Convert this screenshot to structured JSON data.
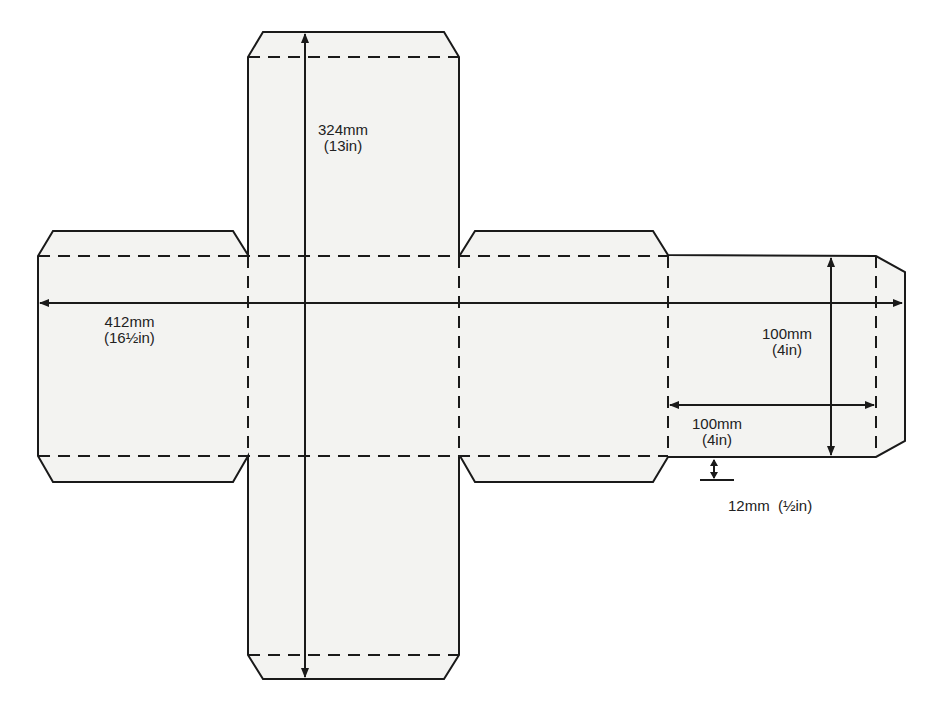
{
  "diagram": {
    "type": "cube-net",
    "colors": {
      "fill": "#f3f3f1",
      "stroke": "#1a1a1a"
    },
    "dimensions": {
      "height": {
        "mm": "324mm",
        "inch": "(13in)"
      },
      "width": {
        "mm": "412mm",
        "inch": "(16½in)"
      },
      "face_height": {
        "mm": "100mm",
        "inch": "(4in)"
      },
      "face_width": {
        "mm": "100mm",
        "inch": "(4in)"
      },
      "flap": {
        "text": "12mm  (½in)"
      }
    }
  }
}
